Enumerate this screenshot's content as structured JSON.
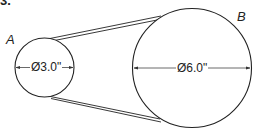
{
  "problem_number": "3.",
  "pulleys": [
    {
      "label": "A",
      "diameter_text": "Ø3.0\"",
      "diameter_in": 3.0
    },
    {
      "label": "B",
      "diameter_text": "Ø6.0\"",
      "diameter_in": 6.0
    }
  ],
  "colors": {
    "stroke": "#1a1a1a",
    "background": "#ffffff"
  }
}
